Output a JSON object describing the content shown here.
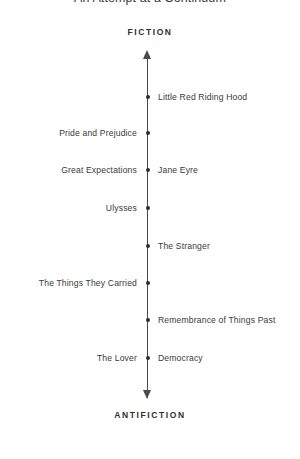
{
  "chart_data": {
    "type": "scatter",
    "title": "An Attempt at a Continuum",
    "orientation": "vertical",
    "axis": {
      "top_label": "FICTION",
      "bottom_label": "ANTIFICTION",
      "arrow_top": "▲",
      "arrow_bottom": "▼"
    },
    "xlabel": "",
    "ylabel": "",
    "grid": false,
    "legend": "none",
    "points": [
      {
        "y": 97,
        "left_label": "",
        "right_label": "Little Red Riding Hood"
      },
      {
        "y": 133,
        "left_label": "Pride and Prejudice",
        "right_label": ""
      },
      {
        "y": 170,
        "left_label": "Great Expectations",
        "right_label": "Jane Eyre"
      },
      {
        "y": 208,
        "left_label": "Ulysses",
        "right_label": ""
      },
      {
        "y": 246,
        "left_label": "",
        "right_label": "The Stranger"
      },
      {
        "y": 283,
        "left_label": "The Things They Carried",
        "right_label": ""
      },
      {
        "y": 320,
        "left_label": "",
        "right_label": "Remembrance of Things Past"
      },
      {
        "y": 358,
        "left_label": "The Lover",
        "right_label": "Democracy"
      }
    ],
    "colors": {
      "background": "#ffffff",
      "axis": "#4a4a4a",
      "text": "#3a3a3a",
      "point": "#2e2e2e"
    }
  }
}
